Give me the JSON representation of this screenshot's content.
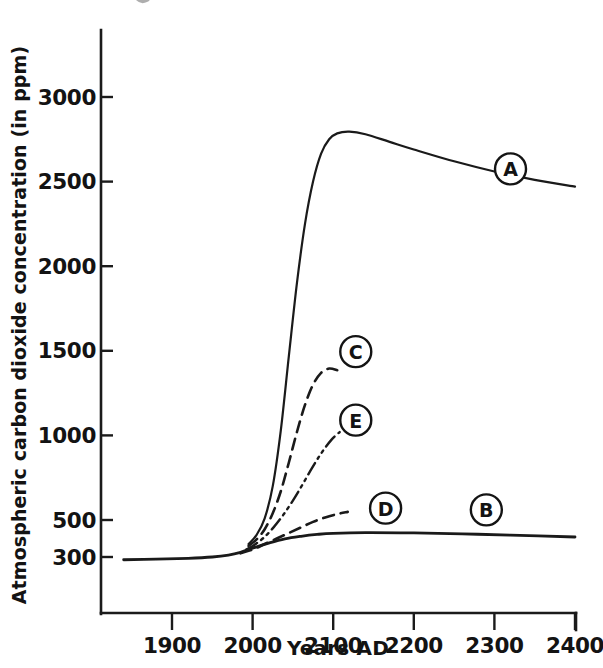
{
  "chart_data": {
    "type": "line",
    "title": "",
    "xlabel": "Years AD",
    "ylabel": "Atmospheric carbon dioxide concentration (in ppm)",
    "xlim": [
      1840,
      2400
    ],
    "ylim": [
      250,
      3150
    ],
    "xticks": [
      1900,
      2000,
      2100,
      2200,
      2300,
      2400
    ],
    "xticklabels": [
      "1900",
      "2000",
      "2100",
      "2200",
      "2300",
      "2400"
    ],
    "yticks": [
      300,
      500,
      1000,
      1500,
      2000,
      2500,
      3000
    ],
    "yticklabels": [
      "300",
      "500",
      "1000",
      "1500",
      "2000",
      "2500",
      "3000"
    ],
    "grid": false,
    "legend": "inline-circled-letters",
    "series": [
      {
        "name": "A",
        "label": "A",
        "style": "solid",
        "label_point": {
          "x": 2320,
          "y": 2575
        },
        "points": [
          {
            "x": 1995,
            "y": 370
          },
          {
            "x": 2005,
            "y": 420
          },
          {
            "x": 2015,
            "y": 510
          },
          {
            "x": 2025,
            "y": 700
          },
          {
            "x": 2035,
            "y": 1030
          },
          {
            "x": 2045,
            "y": 1470
          },
          {
            "x": 2055,
            "y": 1900
          },
          {
            "x": 2065,
            "y": 2250
          },
          {
            "x": 2075,
            "y": 2500
          },
          {
            "x": 2085,
            "y": 2665
          },
          {
            "x": 2095,
            "y": 2750
          },
          {
            "x": 2105,
            "y": 2785
          },
          {
            "x": 2120,
            "y": 2795
          },
          {
            "x": 2140,
            "y": 2780
          },
          {
            "x": 2170,
            "y": 2735
          },
          {
            "x": 2200,
            "y": 2690
          },
          {
            "x": 2250,
            "y": 2620
          },
          {
            "x": 2300,
            "y": 2560
          },
          {
            "x": 2350,
            "y": 2510
          },
          {
            "x": 2400,
            "y": 2470
          }
        ]
      },
      {
        "name": "B",
        "label": "B",
        "style": "solid",
        "label_point": {
          "x": 2290,
          "y": 560
        },
        "points": [
          {
            "x": 1840,
            "y": 285
          },
          {
            "x": 1880,
            "y": 288
          },
          {
            "x": 1920,
            "y": 293
          },
          {
            "x": 1950,
            "y": 300
          },
          {
            "x": 1970,
            "y": 310
          },
          {
            "x": 1985,
            "y": 325
          },
          {
            "x": 2000,
            "y": 348
          },
          {
            "x": 2020,
            "y": 375
          },
          {
            "x": 2040,
            "y": 398
          },
          {
            "x": 2060,
            "y": 412
          },
          {
            "x": 2080,
            "y": 422
          },
          {
            "x": 2100,
            "y": 428
          },
          {
            "x": 2140,
            "y": 432
          },
          {
            "x": 2200,
            "y": 430
          },
          {
            "x": 2260,
            "y": 425
          },
          {
            "x": 2320,
            "y": 418
          },
          {
            "x": 2400,
            "y": 408
          }
        ]
      },
      {
        "name": "C",
        "label": "C",
        "style": "dashed",
        "label_point": {
          "x": 2128,
          "y": 1495
        },
        "points": [
          {
            "x": 1995,
            "y": 360
          },
          {
            "x": 2005,
            "y": 395
          },
          {
            "x": 2015,
            "y": 450
          },
          {
            "x": 2025,
            "y": 540
          },
          {
            "x": 2035,
            "y": 670
          },
          {
            "x": 2045,
            "y": 840
          },
          {
            "x": 2055,
            "y": 1020
          },
          {
            "x": 2065,
            "y": 1180
          },
          {
            "x": 2075,
            "y": 1300
          },
          {
            "x": 2085,
            "y": 1370
          },
          {
            "x": 2095,
            "y": 1395
          },
          {
            "x": 2105,
            "y": 1385
          }
        ]
      },
      {
        "name": "D",
        "label": "D",
        "style": "dashed",
        "label_point": {
          "x": 2165,
          "y": 570
        },
        "points": [
          {
            "x": 1985,
            "y": 320
          },
          {
            "x": 2000,
            "y": 340
          },
          {
            "x": 2015,
            "y": 370
          },
          {
            "x": 2030,
            "y": 400
          },
          {
            "x": 2045,
            "y": 430
          },
          {
            "x": 2060,
            "y": 460
          },
          {
            "x": 2075,
            "y": 490
          },
          {
            "x": 2090,
            "y": 515
          },
          {
            "x": 2105,
            "y": 535
          },
          {
            "x": 2118,
            "y": 548
          }
        ]
      },
      {
        "name": "E",
        "label": "E",
        "style": "dash-dot",
        "label_point": {
          "x": 2128,
          "y": 1090
        },
        "points": [
          {
            "x": 1992,
            "y": 340
          },
          {
            "x": 2002,
            "y": 365
          },
          {
            "x": 2014,
            "y": 405
          },
          {
            "x": 2026,
            "y": 460
          },
          {
            "x": 2038,
            "y": 530
          },
          {
            "x": 2050,
            "y": 615
          },
          {
            "x": 2062,
            "y": 710
          },
          {
            "x": 2074,
            "y": 810
          },
          {
            "x": 2086,
            "y": 900
          },
          {
            "x": 2098,
            "y": 975
          },
          {
            "x": 2108,
            "y": 1020
          }
        ]
      }
    ]
  }
}
